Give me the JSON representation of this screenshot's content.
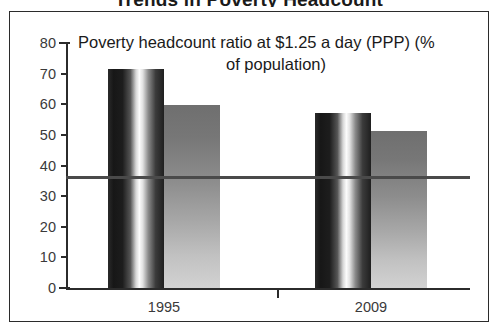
{
  "page": {
    "clipped_top_title": "Trends in Poverty Headcount"
  },
  "chart": {
    "title_line1": "Poverty headcount  ratio at $1.25 a day (PPP) (%",
    "title_line2": "of population)",
    "colors": {
      "axis": "#2b2b2b",
      "tick_label": "#3a3a3a",
      "reference_line": "#4a4a4a",
      "series1_dark": "#171717",
      "series1_light": "#fcfcfc",
      "series2_top": "#6f6f6f",
      "series2_bottom": "#d2d2d2",
      "frame_border": "#2b2b2b",
      "background": "#ffffff"
    }
  },
  "chart_data": {
    "type": "bar",
    "title": "Poverty headcount  ratio at $1.25 a day (PPP) (% of population)",
    "xlabel": "",
    "ylabel": "",
    "categories": [
      "1995",
      "2009"
    ],
    "series": [
      {
        "name": "series-1",
        "values": [
          71.5,
          57.2
        ]
      },
      {
        "name": "series-2",
        "values": [
          59.8,
          51.3
        ]
      }
    ],
    "ylim": [
      0,
      80
    ],
    "yticks": [
      0,
      10,
      20,
      30,
      40,
      50,
      60,
      70,
      80
    ],
    "ytick_labels": [
      "0",
      "10",
      "20",
      "30",
      "40",
      "50",
      "60",
      "70",
      "80"
    ],
    "grid": false,
    "legend": "none",
    "annotations": [
      {
        "type": "horizontal-reference-line",
        "value": 36,
        "label": ""
      }
    ]
  }
}
